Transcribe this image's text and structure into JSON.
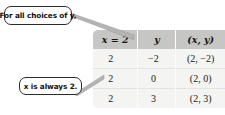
{
  "callouts": {
    "choices": "For all choices of y,",
    "always": "x is always 2."
  },
  "table": {
    "headers": [
      "x = 2",
      "y",
      "(x, y)"
    ],
    "rows": [
      [
        "2",
        "−2",
        "(2, −2)"
      ],
      [
        "2",
        "0",
        "(2, 0)"
      ],
      [
        "2",
        "3",
        "(2, 3)"
      ]
    ]
  },
  "colors": {
    "header_band": "#c6c6c4",
    "body": "#f4f4f2",
    "text": "#1a1a1a",
    "bubble_border": "#2b2b2b",
    "leader_line": "#9a9a9a"
  }
}
